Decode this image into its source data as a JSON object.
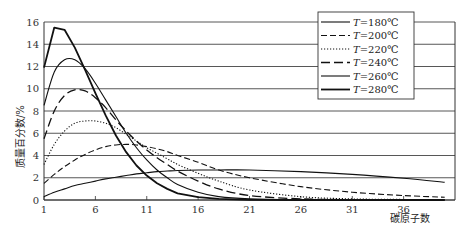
{
  "chart_data": {
    "type": "line",
    "title": "",
    "xlabel": "碳原子数",
    "ylabel": "质量百分数/%",
    "xlim": [
      1,
      41
    ],
    "ylim": [
      0,
      16
    ],
    "xticks": [
      1,
      6,
      11,
      16,
      21,
      26,
      31,
      36
    ],
    "yticks": [
      0,
      2,
      4,
      6,
      8,
      10,
      12,
      14,
      16
    ],
    "grid": "horizontal",
    "legend_position": "upper right",
    "x": [
      1,
      2,
      3,
      4,
      5,
      6,
      7,
      8,
      9,
      10,
      11,
      12,
      13,
      14,
      16,
      18,
      21,
      26,
      31,
      36,
      40
    ],
    "series": [
      {
        "name": "T=180℃",
        "style": "solid-thin",
        "values": [
          0.3,
          0.7,
          1.0,
          1.3,
          1.5,
          1.7,
          1.9,
          2.05,
          2.2,
          2.35,
          2.45,
          2.55,
          2.6,
          2.65,
          2.7,
          2.7,
          2.7,
          2.55,
          2.3,
          1.95,
          1.6
        ]
      },
      {
        "name": "T=200℃",
        "style": "dashed",
        "values": [
          1.5,
          2.3,
          3.0,
          3.6,
          4.1,
          4.5,
          4.8,
          4.95,
          5.0,
          4.95,
          4.8,
          4.6,
          4.35,
          4.0,
          3.4,
          2.7,
          2.0,
          1.2,
          0.7,
          0.4,
          0.25
        ]
      },
      {
        "name": "T=220℃",
        "style": "dotted",
        "values": [
          3.2,
          5.0,
          6.2,
          6.9,
          7.1,
          7.1,
          6.9,
          6.5,
          5.9,
          5.3,
          4.7,
          4.2,
          3.7,
          3.2,
          2.4,
          1.7,
          0.9,
          0.3,
          0.1,
          0.05,
          0.02
        ]
      },
      {
        "name": "T=240℃",
        "style": "long-dash",
        "values": [
          5.5,
          8.0,
          9.4,
          9.9,
          9.8,
          9.2,
          8.3,
          7.2,
          6.2,
          5.3,
          4.5,
          3.8,
          3.2,
          2.6,
          1.7,
          1.0,
          0.4,
          0.1,
          0.03,
          0.01,
          0.0
        ]
      },
      {
        "name": "T=260℃",
        "style": "solid-thin",
        "values": [
          8.5,
          11.5,
          12.6,
          12.6,
          11.8,
          10.5,
          9.0,
          7.5,
          6.0,
          4.7,
          3.6,
          2.7,
          2.0,
          1.4,
          0.7,
          0.3,
          0.1,
          0.02,
          0.0,
          0.0,
          0.0
        ]
      },
      {
        "name": "T=280℃",
        "style": "solid-thick",
        "values": [
          11.9,
          15.5,
          15.3,
          13.7,
          11.7,
          9.6,
          7.6,
          5.8,
          4.3,
          3.1,
          2.2,
          1.5,
          1.0,
          0.6,
          0.25,
          0.1,
          0.02,
          0.0,
          0.0,
          0.0,
          0.0
        ]
      }
    ]
  },
  "legend": {
    "items": [
      {
        "var": "T",
        "text": "=180℃"
      },
      {
        "var": "T",
        "text": "=200℃"
      },
      {
        "var": "T",
        "text": "=220℃"
      },
      {
        "var": "T",
        "text": "=240℃"
      },
      {
        "var": "T",
        "text": "=260℃"
      },
      {
        "var": "T",
        "text": "=280℃"
      }
    ]
  },
  "axes": {
    "ylabel": "质量百分数/%",
    "xlabel": "碳原子数",
    "yticks": [
      "0",
      "2",
      "4",
      "6",
      "8",
      "10",
      "12",
      "14",
      "16"
    ],
    "xticks": [
      "1",
      "6",
      "11",
      "16",
      "21",
      "26",
      "31",
      "36"
    ]
  }
}
